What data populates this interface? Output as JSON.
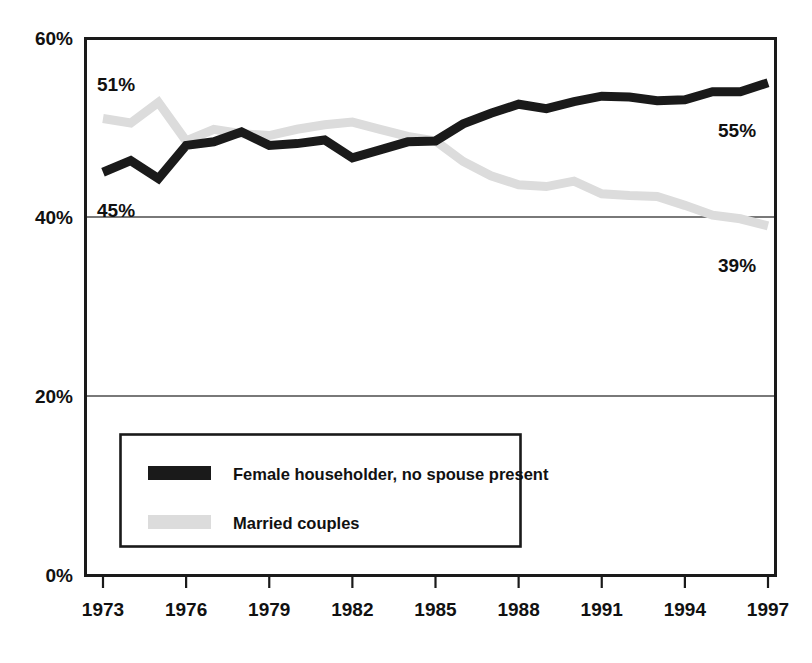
{
  "chart_data": {
    "type": "line",
    "title": "",
    "subtitle": "",
    "xlabel": "",
    "ylabel": "",
    "xlim": [
      1973,
      1997
    ],
    "ylim": [
      0,
      60
    ],
    "y_tick_labels": [
      "0%",
      "20%",
      "40%",
      "60%"
    ],
    "y_ticks": [
      0,
      20,
      40,
      60
    ],
    "x_tick_labels": [
      "1973",
      "1976",
      "1979",
      "1982",
      "1985",
      "1988",
      "1991",
      "1994",
      "1997"
    ],
    "x_ticks": [
      1973,
      1976,
      1979,
      1982,
      1985,
      1988,
      1991,
      1994,
      1997
    ],
    "grid": "horizontal",
    "legend_position": "inside-lower-left",
    "x": [
      1973,
      1974,
      1975,
      1976,
      1977,
      1978,
      1979,
      1980,
      1981,
      1982,
      1983,
      1984,
      1985,
      1986,
      1987,
      1988,
      1989,
      1990,
      1991,
      1992,
      1993,
      1994,
      1995,
      1996,
      1997
    ],
    "series": [
      {
        "name": "Female householder, no spouse present",
        "color": "#1a1a1a",
        "values": [
          45.0,
          46.3,
          44.3,
          48.0,
          48.4,
          49.5,
          48.0,
          48.2,
          48.6,
          46.6,
          47.5,
          48.4,
          48.5,
          50.4,
          51.6,
          52.6,
          52.1,
          52.9,
          53.5,
          53.4,
          53.0,
          53.1,
          54.0,
          54.0,
          55.0
        ]
      },
      {
        "name": "Married couples",
        "color": "#dcdcdc",
        "values": [
          51.0,
          50.5,
          52.8,
          48.5,
          49.8,
          49.3,
          49.1,
          49.8,
          50.3,
          50.6,
          49.8,
          49.0,
          48.5,
          46.2,
          44.6,
          43.6,
          43.4,
          44.0,
          42.6,
          42.4,
          42.3,
          41.3,
          40.2,
          39.8,
          39.0
        ]
      }
    ],
    "annotations": [
      {
        "name": "start-label-married",
        "text": "51%",
        "series": "Married couples",
        "value": 51
      },
      {
        "name": "start-label-female-householder",
        "text": "45%",
        "series": "Female householder, no spouse present",
        "value": 45
      },
      {
        "name": "end-label-female-householder",
        "text": "55%",
        "series": "Female householder, no spouse present",
        "value": 55
      },
      {
        "name": "end-label-married",
        "text": "39%",
        "series": "Married couples",
        "value": 39
      }
    ]
  },
  "legend": {
    "items": [
      {
        "label": "Female householder, no spouse present",
        "color": "#1a1a1a"
      },
      {
        "label": "Married couples",
        "color": "#dcdcdc"
      }
    ]
  },
  "colors": {
    "series_dark": "#1a1a1a",
    "series_light": "#dcdcdc",
    "axis": "#1a1a1a",
    "grid": "#4d4d4d",
    "background": "#ffffff"
  }
}
